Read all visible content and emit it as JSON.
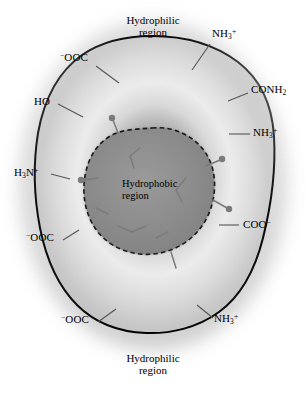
{
  "figure": {
    "width": 306,
    "height": 399,
    "background_color": "#ffffff"
  },
  "regions": {
    "outer_top": {
      "line1": "Hydrophilic",
      "line2": "region"
    },
    "outer_bottom": {
      "line1": "Hydrophilic",
      "line2": "region"
    },
    "core": {
      "line1": "Hydrophobic",
      "line2": "region"
    }
  },
  "colors": {
    "outline": "#000000",
    "core_fill": "#8e8e8e",
    "halo_fill": "#e9e9e9",
    "mid_fill": "#cfcfcf",
    "outer_fill": "#bdbdbd",
    "leader_line": "#555555",
    "sidechain": "#7b7b7b",
    "text": "#000000"
  },
  "labels": [
    {
      "id": "ooc-top-left",
      "text_html": "<sup>−</sup>OOC",
      "plain": "-OOC",
      "x": 60,
      "y": 52,
      "leader": {
        "x1": 96,
        "y1": 66,
        "x2": 119,
        "y2": 83
      }
    },
    {
      "id": "nh3-top-right",
      "text_html": "NH<sub>3</sub><sup>+</sup>",
      "plain": "NH3+",
      "x": 212,
      "y": 28,
      "leader": {
        "x1": 210,
        "y1": 44,
        "x2": 192,
        "y2": 70
      }
    },
    {
      "id": "ho-left",
      "text_html": "HO",
      "plain": "HO",
      "x": 34,
      "y": 96,
      "leader": {
        "x1": 58,
        "y1": 104,
        "x2": 83,
        "y2": 117
      }
    },
    {
      "id": "conh2-right",
      "text_html": "CONH<sub>2</sub>",
      "plain": "CONH2",
      "x": 251,
      "y": 84,
      "leader": {
        "x1": 248,
        "y1": 93,
        "x2": 228,
        "y2": 101
      }
    },
    {
      "id": "nh3-right",
      "text_html": "NH<sub>3</sub><sup>+</sup>",
      "plain": "NH3+",
      "x": 253,
      "y": 127,
      "leader": {
        "x1": 250,
        "y1": 134,
        "x2": 229,
        "y2": 134
      }
    },
    {
      "id": "h3n-left",
      "text_html": "H<sub>3</sub>N<sup>+</sup>",
      "plain": "H3N+",
      "x": 14,
      "y": 167,
      "leader": {
        "x1": 51,
        "y1": 174,
        "x2": 70,
        "y2": 179
      }
    },
    {
      "id": "coo-right",
      "text_html": "COO<sup>−</sup>",
      "plain": "COO-",
      "x": 243,
      "y": 219,
      "leader": {
        "x1": 239,
        "y1": 225,
        "x2": 219,
        "y2": 225
      }
    },
    {
      "id": "ooc-left",
      "text_html": "<sup>−</sup>OOC",
      "plain": "-OOC",
      "x": 26,
      "y": 232,
      "leader": {
        "x1": 63,
        "y1": 240,
        "x2": 79,
        "y2": 230
      }
    },
    {
      "id": "ooc-bottom-left",
      "text_html": "<sup>−</sup>OOC",
      "plain": "-OOC",
      "x": 61,
      "y": 314,
      "leader": {
        "x1": 98,
        "y1": 322,
        "x2": 116,
        "y2": 309
      }
    },
    {
      "id": "nh3-bottom-right",
      "text_html": "NH<sub>3</sub><sup>+</sup>",
      "plain": "NH3+",
      "x": 214,
      "y": 313,
      "leader": {
        "x1": 213,
        "y1": 318,
        "x2": 197,
        "y2": 305
      }
    }
  ],
  "shapes": {
    "outer_blob_path": "M152,36 C186,36 214,44 238,62 C260,79 272,104 274,136 C276,170 271,206 263,238 C255,270 241,296 219,312 C197,328 170,334 146,333 C120,332 95,323 77,305 C58,286 46,258 40,228 C34,197 33,164 38,133 C44,100 58,72 82,55 C101,42 127,36 152,36 Z",
    "core_blob_path": "M152,128 C172,126 190,134 202,148 C213,161 216,178 214,194 C212,211 204,227 191,238 C177,250 158,256 140,254 C121,252 105,243 95,228 C85,213 82,194 85,176 C88,158 97,143 112,135 C124,129 139,129 152,128 Z",
    "sidechains": [
      {
        "bond": "M118,133 L113,120",
        "dot": {
          "cx": 112,
          "cy": 118,
          "r": 3.2
        }
      },
      {
        "bond": "M98,178 L83,180",
        "dot": {
          "cx": 81,
          "cy": 180,
          "r": 3.2
        }
      },
      {
        "bond": "M206,166 L220,160",
        "dot": {
          "cx": 222,
          "cy": 159,
          "r": 3.2
        }
      },
      {
        "bond": "M213,200 L227,208",
        "dot": {
          "cx": 229,
          "cy": 209,
          "r": 3.2
        }
      },
      {
        "bond": "M171,252 L176,268",
        "dot": null
      },
      {
        "bond": "M140,148 L130,156 L134,168",
        "dot": null
      },
      {
        "bond": "M186,178 L176,190 L182,202",
        "dot": null
      },
      {
        "bond": "M118,226 L132,232 L146,226",
        "dot": null
      },
      {
        "bond": "M96,208 L108,214",
        "dot": null
      },
      {
        "bond": "M156,238 L168,232",
        "dot": null
      }
    ]
  }
}
